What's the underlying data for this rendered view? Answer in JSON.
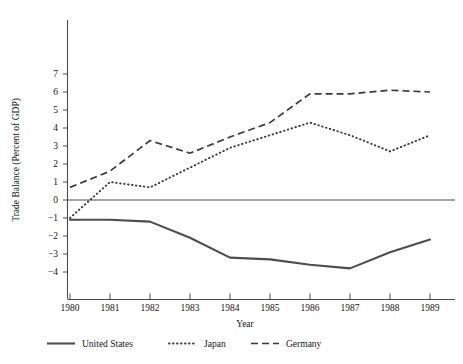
{
  "figure": {
    "top_caption_fragment": "",
    "axis_label_y": "Trade Balance (Percent of GDP)",
    "axis_label_x": "Year"
  },
  "chart_data": {
    "type": "line",
    "title": "",
    "xlabel": "Year",
    "ylabel": "Trade Balance (Percent of GDP)",
    "x": [
      1980,
      1981,
      1982,
      1983,
      1984,
      1985,
      1986,
      1987,
      1988,
      1989
    ],
    "categories": [
      "1980",
      "1981",
      "1982",
      "1983",
      "1984",
      "1985",
      "1986",
      "1987",
      "1988",
      "1989"
    ],
    "xlim": [
      1979.7,
      1989.6
    ],
    "ylim": [
      -4.4,
      7.2
    ],
    "yticks": [
      7,
      6,
      5,
      4,
      3,
      2,
      1,
      0,
      -1,
      -2,
      -3,
      -4
    ],
    "ytick_labels": [
      "7",
      "6",
      "5",
      "4",
      "3",
      "2",
      "1",
      "0",
      "−1",
      "−2",
      "−3",
      "−4"
    ],
    "grid": false,
    "legend_position": "below-axes-left",
    "zero_reference_line": 0,
    "series": [
      {
        "name": "United States",
        "style": "solid",
        "color": "#4d4d4d",
        "values": [
          -1.1,
          -1.1,
          -1.2,
          -2.1,
          -3.2,
          -3.3,
          -3.6,
          -3.8,
          -2.9,
          -2.2
        ]
      },
      {
        "name": "Japan",
        "style": "dotted",
        "color": "#3a3a3a",
        "values": [
          -1.0,
          1.0,
          0.7,
          1.8,
          2.9,
          3.6,
          4.3,
          3.6,
          2.7,
          3.6
        ]
      },
      {
        "name": "Germany",
        "style": "dashed",
        "color": "#3a3a3a",
        "values": [
          0.7,
          1.6,
          3.3,
          2.6,
          3.5,
          4.3,
          5.9,
          5.9,
          6.1,
          6.0
        ]
      }
    ]
  },
  "legend": {
    "items": [
      {
        "label": "United States",
        "style": "solid"
      },
      {
        "label": "Japan",
        "style": "dotted"
      },
      {
        "label": "Germany",
        "style": "dashed"
      }
    ]
  }
}
